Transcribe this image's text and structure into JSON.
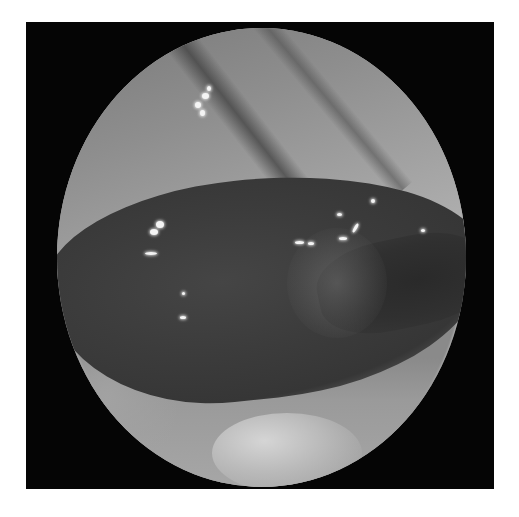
{
  "image": {
    "description": "Grayscale endoscopic view: circular field of view on black square frame showing mucosal folds with a dark irregular central lesion and specular highlights",
    "colors": {
      "background": "#ffffff",
      "frame": "#050505",
      "mucosa_light": "#a8a8a8",
      "lesion_dark": "#363636",
      "highlight": "#f4f4f4"
    }
  }
}
